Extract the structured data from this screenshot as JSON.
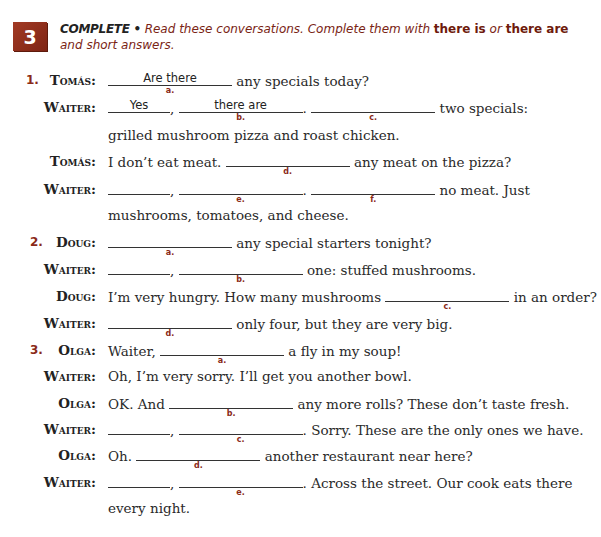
{
  "exercise": {
    "number": "3",
    "instruction_lead": "COMPLETE •",
    "instruction_parts": {
      "p1": " Read these conversations. Complete them with ",
      "b1": "there is",
      "p2": " or ",
      "b2": "there are",
      "p3": " and short answers."
    }
  },
  "conversations": [
    {
      "number": "1.",
      "lines": [
        {
          "speaker": "Tomás:",
          "pre": "",
          "blanks": [
            {
              "label": "a.",
              "answer": "Are there"
            }
          ],
          "post": "any specials today?"
        },
        {
          "speaker": "Waiter:",
          "blanks": [
            {
              "label": "",
              "answer": "Yes"
            },
            {
              "label": "b.",
              "answer": "there are"
            },
            {
              "label": "c.",
              "answer": ""
            }
          ],
          "post": "two specials:"
        },
        {
          "speaker": "",
          "text": "grilled mushroom pizza and roast chicken."
        },
        {
          "speaker": "Tomás:",
          "pre": "I don’t eat meat.",
          "blanks": [
            {
              "label": "d.",
              "answer": ""
            }
          ],
          "post": "any meat on the pizza?"
        },
        {
          "speaker": "Waiter:",
          "blanks": [
            {
              "label": "",
              "answer": ""
            },
            {
              "label": "e.",
              "answer": ""
            },
            {
              "label": "f.",
              "answer": ""
            }
          ],
          "post": "no meat. Just"
        },
        {
          "speaker": "",
          "text": "mushrooms, tomatoes, and cheese."
        }
      ]
    },
    {
      "number": "2.",
      "lines": [
        {
          "speaker": "Doug:",
          "blanks": [
            {
              "label": "a.",
              "answer": ""
            }
          ],
          "post": "any special starters tonight?"
        },
        {
          "speaker": "Waiter:",
          "blanks": [
            {
              "label": "",
              "answer": ""
            },
            {
              "label": "b.",
              "answer": ""
            }
          ],
          "post": "one: stuffed mushrooms."
        },
        {
          "speaker": "Doug:",
          "pre": "I’m very hungry. How many mushrooms",
          "blanks": [
            {
              "label": "c.",
              "answer": ""
            }
          ],
          "post": "in an order?"
        },
        {
          "speaker": "Waiter:",
          "blanks": [
            {
              "label": "d.",
              "answer": ""
            }
          ],
          "post": "only four, but they are very big."
        }
      ]
    },
    {
      "number": "3.",
      "lines": [
        {
          "speaker": "Olga:",
          "pre": "Waiter,",
          "blanks": [
            {
              "label": "a.",
              "answer": ""
            }
          ],
          "post": "a fly in my soup!"
        },
        {
          "speaker": "Waiter:",
          "text": "Oh, I’m very sorry. I’ll get you another bowl."
        },
        {
          "speaker": "Olga:",
          "pre": "OK. And",
          "blanks": [
            {
              "label": "b.",
              "answer": ""
            }
          ],
          "post": "any more rolls? These don’t taste fresh."
        },
        {
          "speaker": "Waiter:",
          "blanks": [
            {
              "label": "",
              "answer": ""
            },
            {
              "label": "c.",
              "answer": ""
            }
          ],
          "post": ". Sorry. These are the only ones we have."
        },
        {
          "speaker": "Olga:",
          "pre": "Oh.",
          "blanks": [
            {
              "label": "d.",
              "answer": ""
            }
          ],
          "post": "another restaurant near here?"
        },
        {
          "speaker": "Waiter:",
          "blanks": [
            {
              "label": "",
              "answer": ""
            },
            {
              "label": "e.",
              "answer": ""
            }
          ],
          "post": ". Across the street. Our cook eats there"
        },
        {
          "speaker": "",
          "text": "every night."
        }
      ]
    }
  ]
}
